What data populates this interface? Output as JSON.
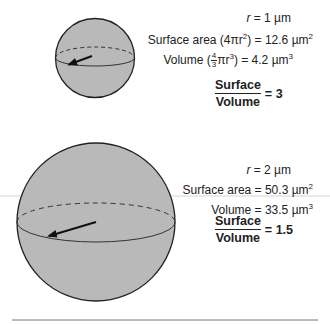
{
  "colors": {
    "sphere_fill": "#b9b9b9",
    "outline": "#222222",
    "divider": "#cfcfcf",
    "text": "#222222"
  },
  "small_sphere": {
    "radius_label_var": "r",
    "radius_label_value": " = 1 µm",
    "surface_area_label": "Surface area (4πr",
    "surface_area_exp": "2",
    "surface_area_value": ") = 12.6 µm",
    "surface_area_unit_exp": "2",
    "volume_label": "Volume (",
    "volume_frac_num": "4",
    "volume_frac_den": "3",
    "volume_pi_r": "πr",
    "volume_exp": "3",
    "volume_value": ") = 4.2 µm",
    "volume_unit_exp": "3",
    "ratio_numerator": "Surface",
    "ratio_denominator": "Volume",
    "ratio_value": "= 3"
  },
  "large_sphere": {
    "radius_label_var": "r",
    "radius_label_value": " = 2 µm",
    "surface_area_label": "Surface area = 50.3 µm",
    "surface_area_unit_exp": "2",
    "volume_label": "Volume = 33.5 µm",
    "volume_unit_exp": "3",
    "ratio_numerator": "Surface",
    "ratio_denominator": "Volume",
    "ratio_value": "= 1.5"
  }
}
